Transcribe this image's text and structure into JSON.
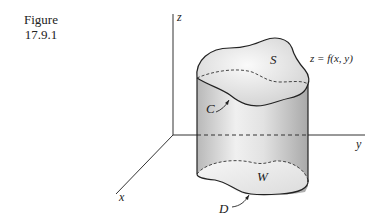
{
  "caption": {
    "label": "Figure",
    "number": "17.9.1"
  },
  "diagram": {
    "axes": {
      "z": "z",
      "y": "y",
      "x": "x"
    },
    "labels": {
      "surface": "S",
      "equation": "z = f(x, y)",
      "boundary_curve": "C",
      "region": "W",
      "base_domain": "D"
    },
    "colors": {
      "line": "#2a2a2a",
      "fill_light": "#f4f4f4",
      "fill_dark": "#bdbdbd"
    }
  }
}
